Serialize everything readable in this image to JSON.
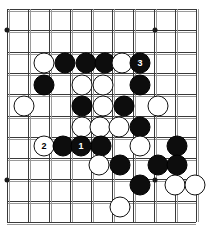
{
  "board": {
    "title": "Go board diagram",
    "size_label": "10x11 visible grid section",
    "cols": 10,
    "rows": 11,
    "origin_x": 7,
    "origin_y": 9,
    "spacing_x": 21,
    "spacing_y": 21.3,
    "colors": {
      "background": "#ffffff",
      "line": "#3a3a3a",
      "line_shadow": "#9a9a9a",
      "black_stone": "#0d0d0d",
      "white_stone": "#ffffff",
      "black_label_text": "#ffffff",
      "white_label_text": "#000000"
    },
    "star_points": [
      {
        "name": "star-point-top-left",
        "x": 7,
        "y": 30
      },
      {
        "name": "star-point-top-right",
        "x": 155,
        "y": 30
      },
      {
        "name": "star-point-bottom-left",
        "x": 7,
        "y": 180
      },
      {
        "name": "star-point-bottom-right",
        "x": 155,
        "y": 180
      }
    ],
    "stones": [
      {
        "color": "white",
        "x": 44,
        "y": 63,
        "label": ""
      },
      {
        "color": "black",
        "x": 65,
        "y": 63,
        "label": ""
      },
      {
        "color": "black",
        "x": 86,
        "y": 63,
        "label": ""
      },
      {
        "color": "black",
        "x": 105,
        "y": 63,
        "label": ""
      },
      {
        "color": "white",
        "x": 122,
        "y": 63,
        "label": ""
      },
      {
        "color": "black",
        "x": 140,
        "y": 63,
        "label": "3"
      },
      {
        "color": "black",
        "x": 44,
        "y": 85,
        "label": ""
      },
      {
        "color": "white",
        "x": 82,
        "y": 85,
        "label": ""
      },
      {
        "color": "white",
        "x": 103,
        "y": 85,
        "label": ""
      },
      {
        "color": "black",
        "x": 140,
        "y": 85,
        "label": ""
      },
      {
        "color": "white",
        "x": 24,
        "y": 106,
        "label": ""
      },
      {
        "color": "black",
        "x": 82,
        "y": 106,
        "label": ""
      },
      {
        "color": "white",
        "x": 103,
        "y": 106,
        "label": ""
      },
      {
        "color": "black",
        "x": 124,
        "y": 106,
        "label": ""
      },
      {
        "color": "white",
        "x": 158,
        "y": 106,
        "label": ""
      },
      {
        "color": "white",
        "x": 82,
        "y": 127,
        "label": ""
      },
      {
        "color": "white",
        "x": 100,
        "y": 127,
        "label": ""
      },
      {
        "color": "white",
        "x": 119,
        "y": 127,
        "label": ""
      },
      {
        "color": "black",
        "x": 140,
        "y": 127,
        "label": ""
      },
      {
        "color": "white",
        "x": 44,
        "y": 146,
        "label": "2"
      },
      {
        "color": "black",
        "x": 63,
        "y": 146,
        "label": ""
      },
      {
        "color": "black",
        "x": 81,
        "y": 146,
        "label": "1"
      },
      {
        "color": "black",
        "x": 101,
        "y": 146,
        "label": ""
      },
      {
        "color": "white",
        "x": 140,
        "y": 146,
        "label": ""
      },
      {
        "color": "black",
        "x": 177,
        "y": 146,
        "label": ""
      },
      {
        "color": "white",
        "x": 99,
        "y": 165,
        "label": ""
      },
      {
        "color": "black",
        "x": 120,
        "y": 165,
        "label": ""
      },
      {
        "color": "black",
        "x": 158,
        "y": 165,
        "label": ""
      },
      {
        "color": "black",
        "x": 177,
        "y": 165,
        "label": ""
      },
      {
        "color": "black",
        "x": 140,
        "y": 185,
        "label": ""
      },
      {
        "color": "white",
        "x": 175,
        "y": 185,
        "label": ""
      },
      {
        "color": "white",
        "x": 195,
        "y": 185,
        "label": ""
      },
      {
        "color": "white",
        "x": 120,
        "y": 207,
        "label": ""
      }
    ]
  }
}
